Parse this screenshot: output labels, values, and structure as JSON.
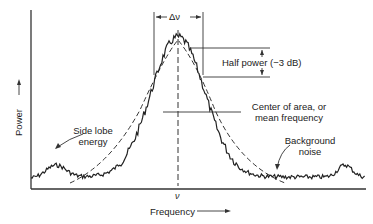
{
  "chart_data": {
    "type": "line",
    "title": "",
    "xlabel": "Frequency",
    "ylabel": "Power",
    "center_marker": "ν",
    "bandwidth_label": "Δν",
    "annotations": [
      {
        "id": "half_power",
        "text": "Half power (−3 dB)"
      },
      {
        "id": "center",
        "text_line1": "Center of area, or",
        "text_line2": "mean frequency"
      },
      {
        "id": "side_lobe",
        "text_line1": "Side lobe",
        "text_line2": "energy"
      },
      {
        "id": "background",
        "text_line1": "Background",
        "text_line2": "noise"
      }
    ],
    "series": [
      {
        "name": "Noisy spectrum",
        "style": "solid jagged"
      },
      {
        "name": "Ideal spectrum",
        "style": "dashed"
      }
    ],
    "grid": false,
    "legend": "none"
  },
  "labels": {
    "delta_nu": "Δν",
    "half_power": "Half power (−3 dB)",
    "center_l1": "Center of area, or",
    "center_l2": "mean frequency",
    "sidelobe_l1": "Side lobe",
    "sidelobe_l2": "energy",
    "bg_l1": "Background",
    "bg_l2": "noise",
    "nu": "ν",
    "x_axis": "Frequency",
    "y_axis": "Power"
  }
}
